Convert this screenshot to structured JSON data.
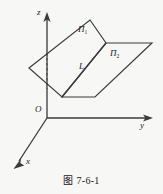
{
  "figure": {
    "caption": "图 7-6-1",
    "background_color": "#f7f7f5",
    "stroke_color": "#3a3a3a"
  },
  "axes": {
    "z_label": "z",
    "y_label": "y",
    "x_label": "x",
    "origin_label": "O",
    "origin": {
      "x": 47,
      "y": 118
    },
    "z_tip": {
      "x": 47,
      "y": 14
    },
    "y_tip": {
      "x": 152,
      "y": 118
    },
    "x_tip": {
      "x": 13,
      "y": 168
    }
  },
  "planes": [
    {
      "name": "plane-pi1",
      "label": "Π",
      "subscript": "1",
      "points": "29,68 90,20 106,43 62,97",
      "fill": "#ffffff",
      "fill_opacity": 0.0
    },
    {
      "name": "plane-pi2",
      "label": "Π",
      "subscript": "2",
      "points": "106,43 152,43 95,97 62,97",
      "fill": "#ffffff",
      "fill_opacity": 0.0
    }
  ],
  "intersection_line": {
    "label": "L",
    "from": {
      "x": 106,
      "y": 43
    },
    "to": {
      "x": 62,
      "y": 97
    }
  },
  "hidden_edge": {
    "name": "dashed-hidden-edge",
    "from": {
      "x": 47,
      "y": 53
    },
    "to": {
      "x": 47,
      "y": 89
    },
    "style": "dashed"
  }
}
